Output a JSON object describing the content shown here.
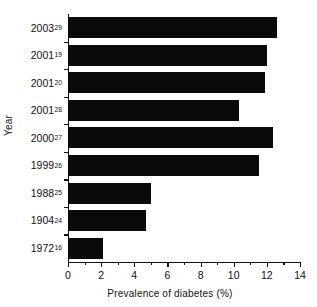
{
  "chart_data": {
    "type": "bar",
    "orientation": "horizontal",
    "title": "",
    "xlabel": "Prevalence of diabetes (%)",
    "ylabel": "Year",
    "xlim": [
      0,
      14
    ],
    "ylim": null,
    "grid": false,
    "legend": null,
    "legend_position": "none",
    "bar_color": "#0a0a0a",
    "background_color": "#ffffff",
    "axis_color": "#111111",
    "x_ticks_major": [
      0,
      2,
      4,
      6,
      8,
      10,
      12,
      14
    ],
    "x_tick_labels": [
      "0",
      "2",
      "4",
      "6",
      "8",
      "10",
      "12",
      "14"
    ],
    "x_ticks_minor": [
      1,
      3,
      5,
      7,
      9,
      11,
      13
    ],
    "categories": [
      "2003²⁹",
      "2001¹⁹",
      "2001²⁰",
      "2001²⁸",
      "2000²⁷",
      "1999²⁶",
      "1988²⁵",
      "1904²⁴",
      "1972¹⁶"
    ],
    "category_parts": [
      {
        "year": "2003",
        "ref": "29"
      },
      {
        "year": "2001",
        "ref": "19"
      },
      {
        "year": "2001",
        "ref": "20"
      },
      {
        "year": "2001",
        "ref": "28"
      },
      {
        "year": "2000",
        "ref": "27"
      },
      {
        "year": "1999",
        "ref": "26"
      },
      {
        "year": "1988",
        "ref": "25"
      },
      {
        "year": "1904",
        "ref": "24"
      },
      {
        "year": "1972",
        "ref": "16"
      }
    ],
    "values": [
      12.6,
      12.0,
      11.9,
      10.3,
      12.4,
      11.5,
      5.0,
      4.7,
      2.1
    ],
    "series": [
      {
        "name": "Prevalence of diabetes (%)",
        "values": [
          12.6,
          12.0,
          11.9,
          10.3,
          12.4,
          11.5,
          5.0,
          4.7,
          2.1
        ]
      }
    ]
  }
}
